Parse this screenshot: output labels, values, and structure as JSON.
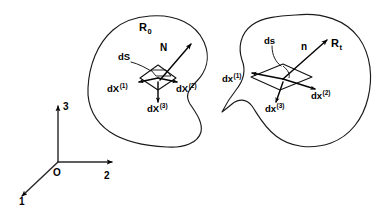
{
  "figure": {
    "background_color": "#ffffff",
    "ink_color": "#000000"
  },
  "coordinate_frame": {
    "origin_label": "O",
    "axes": [
      {
        "name": "axis-1",
        "label": "1",
        "direction": "down-left"
      },
      {
        "name": "axis-2",
        "label": "2",
        "direction": "right"
      },
      {
        "name": "axis-3",
        "label": "3",
        "direction": "up"
      }
    ]
  },
  "regions": [
    {
      "id": "reference",
      "label": "R",
      "subscript": "0",
      "element": {
        "surface_label": "dS",
        "normal_label": "N",
        "vectors": [
          {
            "name": "dX1",
            "base": "dX",
            "superscript": "(1)"
          },
          {
            "name": "dX2",
            "base": "dX",
            "superscript": "(2)"
          },
          {
            "name": "dX3",
            "base": "dX",
            "superscript": "(3)"
          }
        ]
      }
    },
    {
      "id": "current",
      "label": "R",
      "subscript": "t",
      "element": {
        "surface_label": "ds",
        "normal_label": "n",
        "vectors": [
          {
            "name": "dx1",
            "base": "dx",
            "superscript": "(1)"
          },
          {
            "name": "dx2",
            "base": "dx",
            "superscript": "(2)"
          },
          {
            "name": "dx3",
            "base": "dx",
            "superscript": "(3)"
          }
        ]
      }
    }
  ]
}
